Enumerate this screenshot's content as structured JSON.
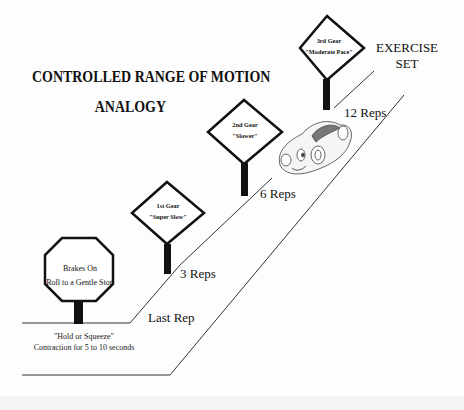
{
  "title": {
    "line1": "CONTROLLED RANGE OF MOTION",
    "line2": "ANALOGY"
  },
  "exercise_set": {
    "line1": "EXERCISE",
    "line2": "SET"
  },
  "signs": [
    {
      "id": "brakes",
      "shape": "octagon",
      "line1": "Brakes On",
      "line2": "Roll to a Gentle Stop"
    },
    {
      "id": "gear1",
      "shape": "diamond",
      "line1": "1st Gear",
      "line2": "\"Super Slow\""
    },
    {
      "id": "gear2",
      "shape": "diamond",
      "line1": "2nd Gear",
      "line2": "\"Slower\""
    },
    {
      "id": "gear3",
      "shape": "diamond",
      "line1": "3rd Gear",
      "line2": "\"Moderate Pace\""
    }
  ],
  "rep_labels": {
    "last": "Last Rep",
    "three": "3 Reps",
    "six": "6 Reps",
    "twelve": "12 Reps"
  },
  "hold_note": {
    "line1": "\"Hold or Squeeze\"",
    "line2": "Contraction for 5 to 10 seconds"
  },
  "illustration": {
    "car": "cartoon-car-icon"
  },
  "colors": {
    "ink": "#111111",
    "background": "#fdfdfd",
    "road_line": "#333333"
  }
}
